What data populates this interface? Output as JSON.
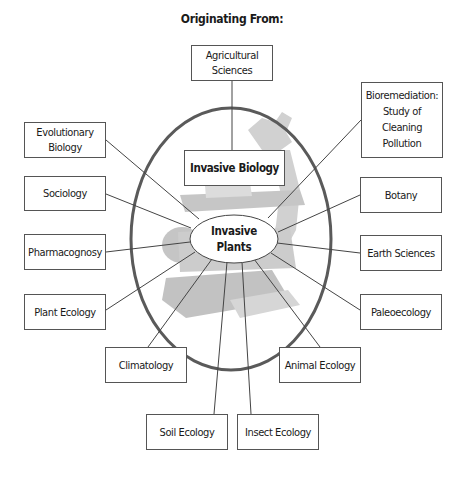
{
  "title": "Originating From:",
  "center": {
    "label_line1": "Invasive",
    "label_line2": "Plants"
  },
  "hub": {
    "label": "Invasive Biology"
  },
  "disciplines": {
    "agricultural_sciences": {
      "line1": "Agricultural",
      "line2": "Sciences"
    },
    "bioremediation": {
      "line1": "Bioremediation:",
      "line2": "Study of",
      "line3": "Cleaning",
      "line4": "Pollution"
    },
    "evolutionary_biology": {
      "line1": "Evolutionary",
      "line2": "Biology"
    },
    "sociology": {
      "label": "Sociology"
    },
    "pharmacognosy": {
      "label": "Pharmacognosy"
    },
    "plant_ecology": {
      "label": "Plant Ecology"
    },
    "climatology": {
      "label": "Climatology"
    },
    "soil_ecology": {
      "label": "Soil Ecology"
    },
    "insect_ecology": {
      "label": "Insect Ecology"
    },
    "animal_ecology": {
      "label": "Animal Ecology"
    },
    "paleoecology": {
      "label": "Paleoecology"
    },
    "earth_sciences": {
      "label": "Earth Sciences"
    },
    "botany": {
      "label": "Botany"
    }
  },
  "colors": {
    "stroke": "#555555",
    "circle": "#5a5a5a",
    "microscope": "#c8c8c8",
    "background": "#ffffff"
  },
  "background_image": "microscope-silhouette"
}
